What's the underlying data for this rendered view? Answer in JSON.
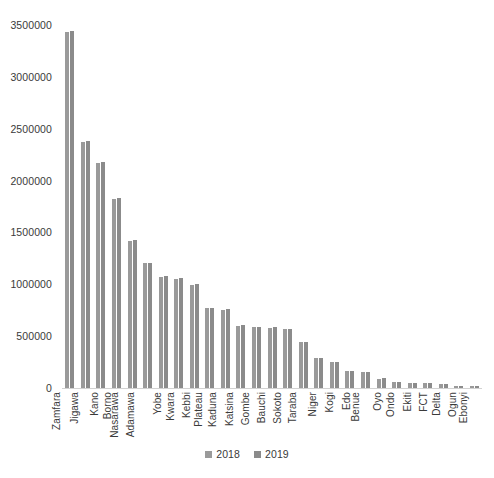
{
  "chart_data": {
    "type": "bar",
    "title": "",
    "subtitle": "",
    "xlabel": "",
    "ylabel": "",
    "ylim": [
      0,
      3500000
    ],
    "yticks": [
      0,
      500000,
      1000000,
      1500000,
      2000000,
      2500000,
      3000000,
      3500000
    ],
    "ytick_labels": [
      "0",
      "500000",
      "1000000",
      "1500000",
      "2000000",
      "2500000",
      "3000000",
      "3500000"
    ],
    "grid": false,
    "legend_position": "bottom",
    "categories": [
      "Zamfara",
      "Jigawa",
      "Kano",
      "Borno",
      "Nasarawa",
      "Adamawa",
      "Yobe",
      "Kwara",
      "Kebbi",
      "Plateau",
      "Kaduna",
      "Katsina",
      "Gombe",
      "Bauchi",
      "Sokoto",
      "Taraba",
      "Niger",
      "Kogi",
      "Edo",
      "Benue",
      "Oyo",
      "Ondo",
      "Ekiti",
      "FCT",
      "Delta",
      "Ogun",
      "Ebonyi"
    ],
    "series": [
      {
        "name": "2018",
        "color": "#9a9a9a",
        "values": [
          3430000,
          2370000,
          2165000,
          1825000,
          1420000,
          1205000,
          1075000,
          1055000,
          995000,
          770000,
          755000,
          600000,
          585000,
          580000,
          565000,
          440000,
          285000,
          250000,
          160000,
          155000,
          90000,
          55000,
          50000,
          45000,
          40000,
          18000,
          15000
        ]
      },
      {
        "name": "2019",
        "color": "#8b8b8b",
        "values": [
          3445000,
          2385000,
          2175000,
          1835000,
          1425000,
          1210000,
          1080000,
          1060000,
          1000000,
          775000,
          760000,
          605000,
          590000,
          585000,
          570000,
          445000,
          290000,
          255000,
          165000,
          158000,
          95000,
          58000,
          52000,
          47000,
          42000,
          20000,
          16000
        ]
      }
    ],
    "legend": [
      {
        "label": "2018",
        "color": "#9a9a9a"
      },
      {
        "label": "2019",
        "color": "#8b8b8b"
      }
    ]
  }
}
